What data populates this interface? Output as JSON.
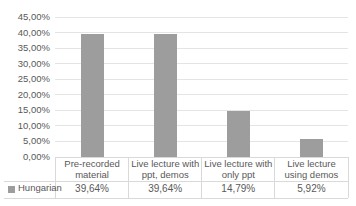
{
  "chart_data": {
    "type": "bar",
    "title": "",
    "xlabel": "",
    "ylabel": "",
    "categories": [
      "Pre-recorded material",
      "Live lecture with ppt, demos",
      "Live lecture with only ppt",
      "Live lecture using demos"
    ],
    "categories_wrapped": [
      "Pre-recorded\nmaterial",
      "Live lecture with\nppt, demos",
      "Live lecture with\nonly ppt",
      "Live lecture\nusing demos"
    ],
    "series": [
      {
        "name": "Hungarian",
        "values": [
          39.64,
          39.64,
          14.79,
          5.92
        ],
        "value_labels": [
          "39,64%",
          "39,64%",
          "14,79%",
          "5,92%"
        ]
      }
    ],
    "ylim": [
      0,
      45
    ],
    "y_tick_step": 5,
    "y_tick_labels": [
      "0,00%",
      "5,00%",
      "10,00%",
      "15,00%",
      "20,00%",
      "25,00%",
      "30,00%",
      "35,00%",
      "40,00%",
      "45,00%"
    ],
    "grid": true,
    "legend_position": "bottom-left-data-table",
    "data_table_shown": true,
    "colors": {
      "bar": "#9d9d9d",
      "gridline": "#e4e4e4",
      "table_border": "#d9d9d9",
      "text": "#595959",
      "background": "#ffffff"
    }
  }
}
